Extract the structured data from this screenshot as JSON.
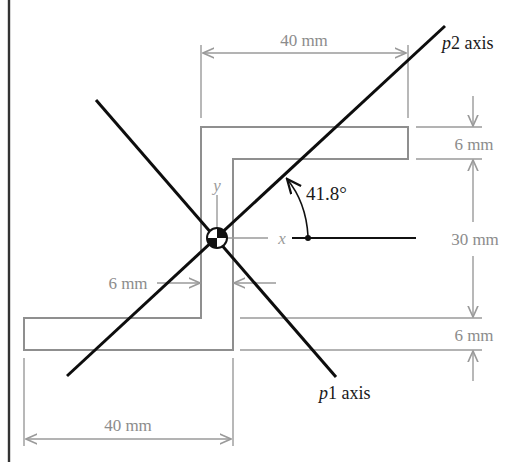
{
  "figure": {
    "shape": "Z-section",
    "dimensions": {
      "top_flange_width": "40 mm",
      "top_flange_thickness": "6 mm",
      "web_height": "30 mm",
      "web_thickness": "6 mm",
      "bottom_flange_thickness": "6 mm",
      "bottom_flange_width": "40 mm"
    },
    "axes": {
      "x_label": "x",
      "y_label": "y",
      "p1": {
        "symbol": "p",
        "index": "1",
        "suffix": " axis"
      },
      "p2": {
        "symbol": "p",
        "index": "2",
        "suffix": " axis"
      },
      "angle_label": "41.8°"
    },
    "centroid": {
      "symbol": "centroid-marker"
    }
  },
  "colors": {
    "outline": "#8f8f8f",
    "dimension": "#9a9a9a",
    "principal_axes": "#0d0d0d",
    "background": "#ffffff"
  }
}
